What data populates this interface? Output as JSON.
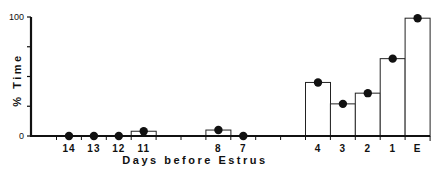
{
  "chart_data": {
    "type": "bar",
    "title": "",
    "xlabel": "Days before Estrus",
    "ylabel": "% Time",
    "ylim": [
      0,
      100
    ],
    "yticks": [
      0,
      25,
      50,
      75,
      100
    ],
    "ytick_labels": [
      "0",
      "",
      "",
      "",
      "100"
    ],
    "grid": false,
    "legend": null,
    "categories": [
      "14",
      "13",
      "12",
      "11",
      "10",
      "9",
      "8",
      "7",
      "6",
      "5",
      "4",
      "3",
      "2",
      "1",
      "E"
    ],
    "values": [
      0,
      0,
      0,
      4,
      null,
      null,
      5,
      0,
      null,
      null,
      45,
      27,
      36,
      65,
      99
    ],
    "series": [
      {
        "name": "% Time (bar)",
        "style": "open-bar",
        "values": [
          0,
          0,
          0,
          4,
          null,
          null,
          5,
          0,
          null,
          null,
          45,
          27,
          36,
          65,
          99
        ]
      },
      {
        "name": "% Time (point)",
        "style": "filled-circle",
        "values": [
          0,
          0,
          0,
          4,
          null,
          null,
          5,
          0,
          null,
          null,
          45,
          27,
          36,
          65,
          99
        ]
      }
    ],
    "visible_x_labels": [
      "14",
      "13",
      "12",
      "11",
      "8",
      "7",
      "4",
      "3",
      "2",
      "1",
      "E"
    ],
    "colors": {
      "bar_fill": "#ffffff",
      "bar_stroke": "#222222",
      "point": "#111111",
      "axis": "#111111"
    }
  }
}
